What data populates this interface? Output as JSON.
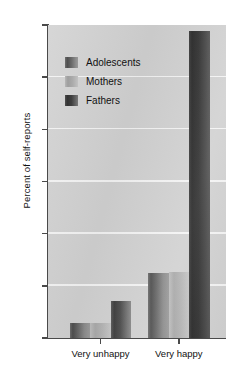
{
  "chart_data": {
    "type": "bar",
    "title": "",
    "subtitle": "",
    "xlabel": "",
    "ylabel": "Percent of self-reports",
    "categories": [
      "Very unhappy",
      "Very happy"
    ],
    "series": [
      {
        "name": "Adolescents",
        "values": [
          1.4,
          6.2
        ],
        "color": "#5a5a5a"
      },
      {
        "name": "Mothers",
        "values": [
          1.4,
          6.3
        ],
        "color": "#b0b0b0"
      },
      {
        "name": "Fathers",
        "values": [
          3.5,
          29.4
        ],
        "color": "#3a3a3a"
      }
    ],
    "ylim": [
      0,
      30
    ],
    "yticks": [
      0,
      5,
      10,
      15,
      20,
      25,
      30
    ],
    "ytick_labels": [
      "0",
      "5",
      "10",
      "15",
      "20",
      "25",
      "30"
    ],
    "grid": "horizontal",
    "grid_color": "#f4f4f4",
    "plot_background": "#d2d2d2",
    "figure_background": "#ffffff",
    "legend_position": "upper-left-inside"
  },
  "axes": {
    "y_title": "Percent of self-reports",
    "y_tick_labels": [
      "30",
      "25",
      "20",
      "15",
      "10",
      "5",
      "0"
    ],
    "x_tick_labels": [
      "Very unhappy",
      "Very happy"
    ]
  },
  "legend": {
    "entries": [
      {
        "label": "Adolescents",
        "swatch": "adolescents-swatch"
      },
      {
        "label": "Mothers",
        "swatch": "mothers-swatch"
      },
      {
        "label": "Fathers",
        "swatch": "fathers-swatch"
      }
    ]
  }
}
